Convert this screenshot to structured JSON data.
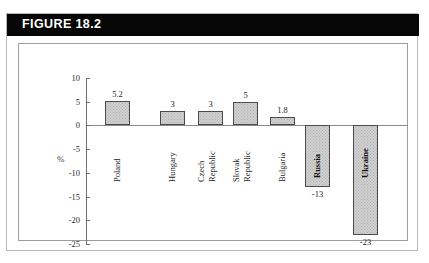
{
  "figure": {
    "header_label": "FIGURE 18.2",
    "header_bg": "#060606",
    "header_text_color": "#ffffff",
    "card_border": "#b9b9b9",
    "plot_border": "#9d9d9d"
  },
  "chart_data": {
    "type": "bar",
    "title": "FIGURE 18.2",
    "xlabel": "",
    "ylabel": "%",
    "ylim": [
      -25,
      10
    ],
    "yticks": [
      10,
      5,
      0,
      -5,
      -10,
      -15,
      -20,
      -25
    ],
    "ytick_labels": [
      "10",
      "5",
      "0",
      "-5",
      "-10",
      "-15",
      "-20",
      "-25"
    ],
    "grid": false,
    "legend": "none",
    "zero_line": true,
    "bar_fill": "#cfcfcf",
    "bar_edge": "#4a4a4a",
    "categories": [
      "Poland",
      "Hungary",
      "Czech Republic",
      "Slovak Republic",
      "Bulgaria",
      "Russia",
      "Ukraine"
    ],
    "values": [
      5.2,
      3,
      3,
      5,
      1.8,
      -13,
      -23
    ],
    "value_labels": [
      "5.2",
      "3",
      "3",
      "5",
      "1.8",
      "-13",
      "-23"
    ],
    "bars": [
      {
        "category": "Poland",
        "label_lines": [
          "Poland"
        ],
        "value": 5.2,
        "value_label": "5.2",
        "label_position": "below-axis"
      },
      {
        "category": "Hungary",
        "label_lines": [
          "Hungary"
        ],
        "value": 3,
        "value_label": "3",
        "label_position": "below-axis"
      },
      {
        "category": "Czech Republic",
        "label_lines": [
          "Czech",
          "Republic"
        ],
        "value": 3,
        "value_label": "3",
        "label_position": "below-axis"
      },
      {
        "category": "Slovak Republic",
        "label_lines": [
          "Slovak",
          "Republic"
        ],
        "value": 5,
        "value_label": "5",
        "label_position": "below-axis"
      },
      {
        "category": "Bulgaria",
        "label_lines": [
          "Bulgaria"
        ],
        "value": 1.8,
        "value_label": "1.8",
        "label_position": "below-axis"
      },
      {
        "category": "Russia",
        "label_lines": [
          "Russia"
        ],
        "value": -13,
        "value_label": "-13",
        "label_position": "inside-bar"
      },
      {
        "category": "Ukraine",
        "label_lines": [
          "Ukraine"
        ],
        "value": -23,
        "value_label": "-23",
        "label_position": "inside-bar"
      }
    ]
  }
}
